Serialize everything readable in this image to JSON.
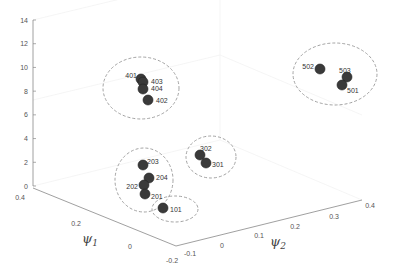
{
  "chart_data": {
    "type": "scatter",
    "projection": "3d",
    "title": "",
    "xlabel": "ψ1",
    "ylabel": "ψ2",
    "zlabel": "",
    "axes": {
      "psi1": {
        "label": "ψ1",
        "ticks": [
          "0.4",
          "0.2",
          "0",
          "-0.2"
        ],
        "range": [
          -0.2,
          0.4
        ]
      },
      "psi2": {
        "label": "ψ2",
        "ticks": [
          "-0.1",
          "0",
          "0.1",
          "0.2",
          "0.3",
          "0.4"
        ],
        "range": [
          -0.1,
          0.4
        ]
      },
      "z": {
        "label": "",
        "ticks": [
          "0",
          "2",
          "4",
          "6",
          "8",
          "10",
          "12",
          "14"
        ],
        "range": [
          0,
          14
        ]
      }
    },
    "grid": true,
    "marker_color": "#3a3a3a",
    "cluster_outline": "dashed",
    "clusters": [
      {
        "name": "cluster-100",
        "points": [
          {
            "label": "101",
            "px": [
              163,
              208
            ]
          }
        ],
        "ellipse": {
          "cx": 175,
          "cy": 209,
          "rx": 23,
          "ry": 13
        }
      },
      {
        "name": "cluster-200",
        "points": [
          {
            "label": "203",
            "px": [
              143,
              165
            ]
          },
          {
            "label": "204",
            "px": [
              149,
              178
            ]
          },
          {
            "label": "202",
            "px": [
              144,
              185
            ]
          },
          {
            "label": "201",
            "px": [
              145,
              194
            ]
          }
        ],
        "ellipse": {
          "cx": 144,
          "cy": 180,
          "rx": 29,
          "ry": 32
        }
      },
      {
        "name": "cluster-300",
        "points": [
          {
            "label": "302",
            "px": [
              200,
              155
            ]
          },
          {
            "label": "301",
            "px": [
              206,
              163
            ]
          }
        ],
        "ellipse": {
          "cx": 211,
          "cy": 157,
          "rx": 25,
          "ry": 21
        }
      },
      {
        "name": "cluster-400",
        "points": [
          {
            "label": "401",
            "px": [
              141,
              79
            ]
          },
          {
            "label": "403",
            "px": [
              143,
              82
            ]
          },
          {
            "label": "404",
            "px": [
              143,
              89
            ]
          },
          {
            "label": "402",
            "px": [
              148,
              100
            ]
          }
        ],
        "ellipse": {
          "cx": 141,
          "cy": 88,
          "rx": 38,
          "ry": 31
        }
      },
      {
        "name": "cluster-500",
        "points": [
          {
            "label": "502",
            "px": [
              320,
              69
            ]
          },
          {
            "label": "503",
            "px": [
              347,
              77
            ]
          },
          {
            "label": "501",
            "px": [
              342,
              85
            ]
          }
        ],
        "ellipse": {
          "cx": 335,
          "cy": 74,
          "rx": 42,
          "ry": 31
        }
      }
    ]
  }
}
